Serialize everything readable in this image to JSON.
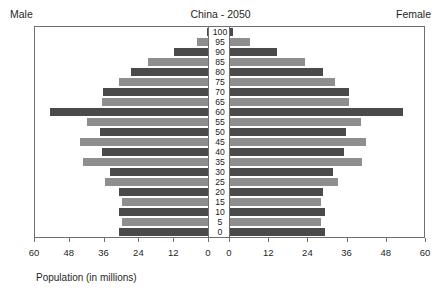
{
  "header": {
    "male_label": "Male",
    "female_label": "Female",
    "title": "China - 2050"
  },
  "axis": {
    "xlabel": "Population (in millions)",
    "left_ticks": [
      "60",
      "48",
      "36",
      "24",
      "12",
      "0"
    ],
    "right_ticks": [
      "0",
      "12",
      "24",
      "36",
      "48",
      "60"
    ]
  },
  "colors": {
    "bar_dark": "#4a4a4a",
    "bar_light": "#8e8e8e",
    "frame": "#6f6f6f",
    "text": "#1f1f1f",
    "background": "#ffffff"
  },
  "chart_data": {
    "type": "bar",
    "subtype": "population-pyramid",
    "title": "China - 2050",
    "xlabel": "Population (in millions)",
    "ylabel": "",
    "left_panel_label": "Male",
    "right_panel_label": "Female",
    "xlim": [
      0,
      60
    ],
    "xticks": [
      0,
      12,
      24,
      36,
      48,
      60
    ],
    "grid": false,
    "legend": "none",
    "categories": [
      "0",
      "5",
      "10",
      "15",
      "20",
      "25",
      "30",
      "35",
      "40",
      "45",
      "50",
      "55",
      "60",
      "65",
      "70",
      "75",
      "80",
      "85",
      "90",
      "95",
      "100"
    ],
    "series": [
      {
        "name": "Male",
        "direction": "left",
        "values": [
          31.0,
          30.0,
          31.0,
          30.0,
          31.0,
          36.0,
          34.0,
          43.5,
          37.0,
          44.5,
          37.5,
          42.0,
          55.0,
          37.0,
          36.5,
          31.0,
          27.0,
          21.0,
          12.0,
          4.0,
          0.8
        ]
      },
      {
        "name": "Female",
        "direction": "right",
        "values": [
          29.0,
          28.0,
          29.0,
          28.0,
          28.5,
          33.0,
          31.5,
          40.5,
          35.0,
          41.5,
          35.5,
          40.0,
          53.0,
          36.5,
          36.5,
          32.0,
          28.5,
          23.0,
          14.5,
          6.0,
          1.0
        ]
      }
    ]
  }
}
